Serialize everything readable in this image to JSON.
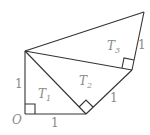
{
  "diagram": {
    "labels": {
      "origin": "O",
      "left_side": "1",
      "bottom_side": "1",
      "t2_side": "1",
      "t3_side": "1",
      "t1": "T",
      "t1_sub": "1",
      "t2": "T",
      "t2_sub": "2",
      "t3": "T",
      "t3_sub": "3"
    },
    "colors": {
      "line": "#333333",
      "label": "#888888"
    }
  }
}
